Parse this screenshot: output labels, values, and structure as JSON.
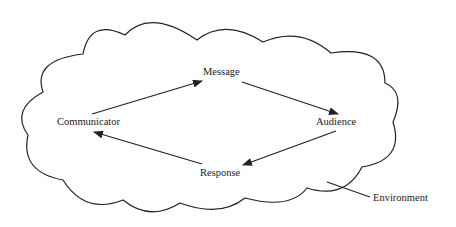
{
  "diagram": {
    "type": "communication-process",
    "nodes": [
      {
        "id": "message",
        "label": "Message"
      },
      {
        "id": "audience",
        "label": "Audience"
      },
      {
        "id": "response",
        "label": "Response"
      },
      {
        "id": "communicator",
        "label": "Communicator"
      }
    ],
    "edges": [
      {
        "from": "communicator",
        "to": "message"
      },
      {
        "from": "message",
        "to": "audience"
      },
      {
        "from": "audience",
        "to": "response"
      },
      {
        "from": "response",
        "to": "communicator"
      }
    ],
    "container": {
      "label": "Environment",
      "shape": "cloud"
    },
    "colors": {
      "stroke": "#222222",
      "background": "#ffffff"
    }
  }
}
